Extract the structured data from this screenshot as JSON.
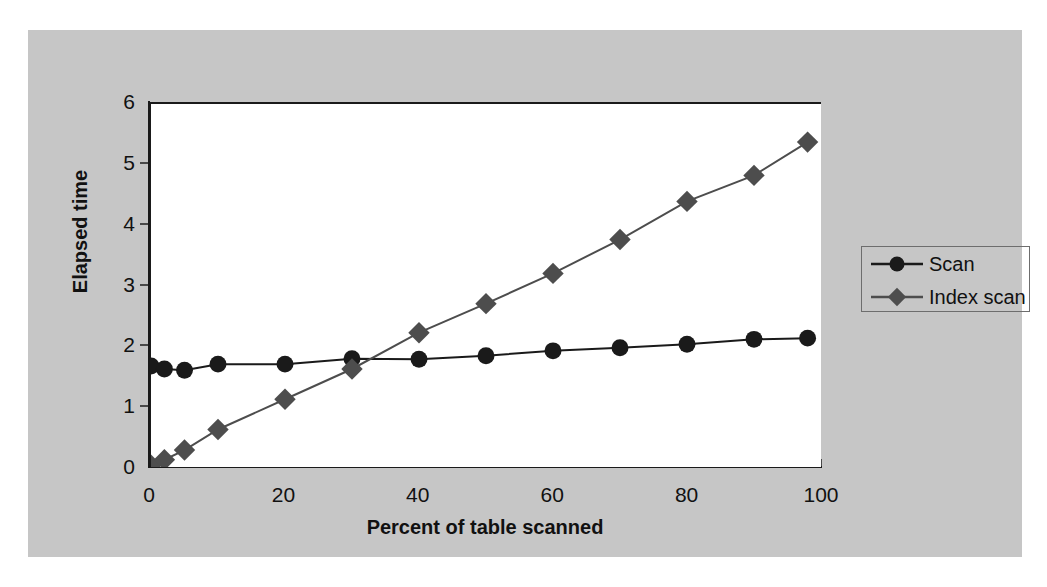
{
  "chart_data": {
    "type": "line",
    "title": "",
    "xlabel": "Percent of table scanned",
    "ylabel": "Elapsed time",
    "xlim": [
      0,
      100
    ],
    "ylim": [
      0,
      6
    ],
    "grid": false,
    "legend_position": "right",
    "xticks": [
      "0",
      "20",
      "40",
      "60",
      "80",
      "100"
    ],
    "xtick_values": [
      0,
      20,
      40,
      60,
      80,
      100
    ],
    "yticks": [
      "0",
      "1",
      "2",
      "3",
      "4",
      "5",
      "6"
    ],
    "ytick_values": [
      0,
      1,
      2,
      3,
      4,
      5,
      6
    ],
    "x": [
      0,
      2,
      5,
      10,
      20,
      30,
      40,
      50,
      60,
      70,
      80,
      90,
      98
    ],
    "series": [
      {
        "name": "Scan",
        "marker": "circle",
        "color": "#1a1a1a",
        "values": [
          1.67,
          1.62,
          1.6,
          1.7,
          1.7,
          1.79,
          1.78,
          1.84,
          1.92,
          1.97,
          2.03,
          2.11,
          2.13
        ]
      },
      {
        "name": "Index scan",
        "marker": "diamond",
        "color": "#4d4d4d",
        "values": [
          0.03,
          0.12,
          0.28,
          0.62,
          1.12,
          1.62,
          2.22,
          2.7,
          3.2,
          3.76,
          4.39,
          4.82,
          5.37
        ]
      }
    ]
  },
  "legend": {
    "items": [
      {
        "label": "Scan",
        "marker": "circle"
      },
      {
        "label": "Index scan",
        "marker": "diamond"
      }
    ]
  },
  "colors": {
    "panel_background": "#c6c6c6",
    "plot_background": "#ffffff",
    "axis": "#1a1a1a",
    "series_scan": "#1a1a1a",
    "series_index_scan": "#4d4d4d"
  }
}
